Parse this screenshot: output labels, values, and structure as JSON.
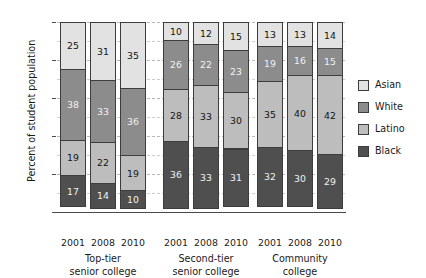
{
  "chart_data": {
    "type": "bar",
    "subtype": "stacked-column-100",
    "title": "",
    "xlabel": "",
    "ylabel": "Percent of student population",
    "ylim": [
      0,
      100
    ],
    "ytick_step": 20,
    "minor_gridline_step": 10,
    "grid": true,
    "legend_position": "right",
    "categories": [
      "2001",
      "2008",
      "2010",
      "2001",
      "2008",
      "2010",
      "2001",
      "2008",
      "2010"
    ],
    "groups": [
      {
        "name": "Top-tier senior college",
        "name_line1": "Top-tier",
        "name_line2": "senior college",
        "years": [
          "2001",
          "2008",
          "2010"
        ]
      },
      {
        "name": "Second-tier senior college",
        "name_line1": "Second-tier",
        "name_line2": "senior college",
        "years": [
          "2001",
          "2008",
          "2010"
        ]
      },
      {
        "name": "Community college",
        "name_line1": "Community",
        "name_line2": "college",
        "years": [
          "2001",
          "2008",
          "2010"
        ]
      }
    ],
    "series": [
      {
        "name": "Asian",
        "color": "#e2e2e2",
        "values": [
          25,
          31,
          35,
          10,
          12,
          15,
          13,
          13,
          14
        ]
      },
      {
        "name": "White",
        "color": "#8c8c8c",
        "values": [
          38,
          33,
          36,
          26,
          22,
          23,
          19,
          16,
          15
        ]
      },
      {
        "name": "Latino",
        "color": "#bdbdbd",
        "values": [
          19,
          22,
          19,
          28,
          33,
          30,
          35,
          40,
          42
        ]
      },
      {
        "name": "Black",
        "color": "#4f4f4f",
        "values": [
          17,
          14,
          10,
          36,
          33,
          31,
          32,
          30,
          29
        ]
      }
    ],
    "ytick_labels": [
      "100",
      "80",
      "60",
      "40",
      "20",
      "0"
    ],
    "ytick_values": [
      100,
      80,
      60,
      40,
      20,
      0
    ]
  },
  "legend": {
    "items": [
      {
        "label": "Asian",
        "key": "asian"
      },
      {
        "label": "White",
        "key": "white"
      },
      {
        "label": "Latino",
        "key": "latino"
      },
      {
        "label": "Black",
        "key": "black"
      }
    ]
  }
}
